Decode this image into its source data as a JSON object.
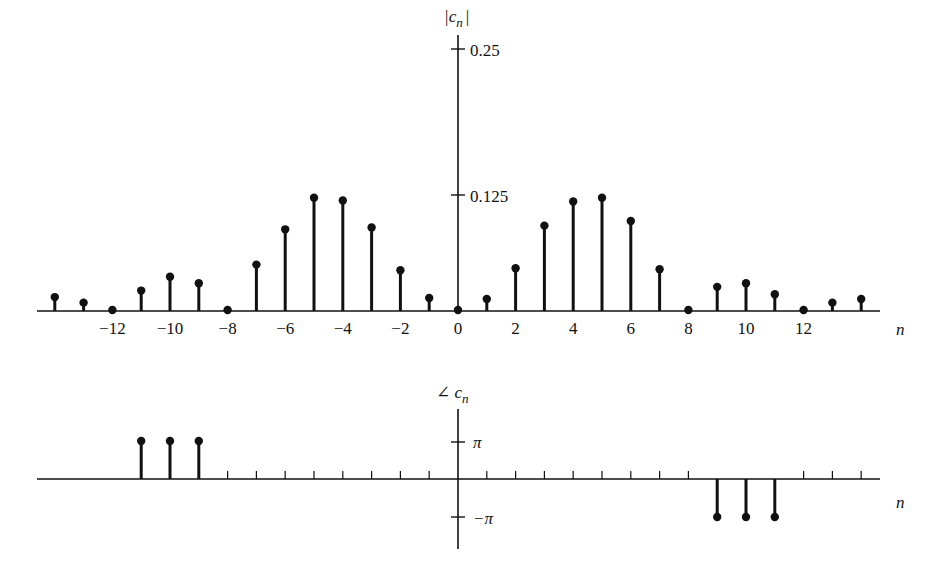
{
  "chart_data": [
    {
      "type": "stem",
      "title": "",
      "ylabel": "|c_n|",
      "xlabel": "n",
      "ytick_labels": [
        "0.125",
        "0.25"
      ],
      "yticks": [
        0.125,
        0.25
      ],
      "xtick_labels": [
        "-12",
        "-10",
        "-8",
        "-6",
        "-4",
        "-2",
        "0",
        "2",
        "4",
        "6",
        "8",
        "10",
        "12"
      ],
      "x": [
        -14,
        -13,
        -12,
        -11,
        -10,
        -9,
        -8,
        -7,
        -6,
        -5,
        -4,
        -3,
        -2,
        -1,
        0,
        1,
        2,
        3,
        4,
        5,
        6,
        7,
        8,
        9,
        10,
        11,
        12,
        13,
        14
      ],
      "values": [
        0.015,
        0.009,
        0.0,
        0.022,
        0.037,
        0.03,
        0.0,
        0.05,
        0.088,
        0.122,
        0.119,
        0.09,
        0.044,
        0.014,
        0.0,
        0.013,
        0.046,
        0.092,
        0.118,
        0.122,
        0.097,
        0.045,
        0.0,
        0.026,
        0.03,
        0.018,
        0.0,
        0.009,
        0.013
      ],
      "grid": false
    },
    {
      "type": "stem",
      "title": "",
      "ylabel": "∠ c_n",
      "xlabel": "n",
      "ytick_labels": [
        "π",
        "−π"
      ],
      "yticks": [
        3.1416,
        -3.1416
      ],
      "x": [
        -14,
        -13,
        -12,
        -11,
        -10,
        -9,
        -8,
        -7,
        -6,
        -5,
        -4,
        -3,
        -2,
        -1,
        0,
        1,
        2,
        3,
        4,
        5,
        6,
        7,
        8,
        9,
        10,
        11,
        12,
        13,
        14
      ],
      "values": [
        0,
        0,
        0,
        3.1416,
        3.1416,
        3.1416,
        0,
        0,
        0,
        0,
        0,
        0,
        0,
        0,
        0,
        0,
        0,
        0,
        0,
        0,
        0,
        0,
        0,
        -3.1416,
        -3.1416,
        -3.1416,
        0,
        0,
        0
      ],
      "grid": false
    }
  ],
  "magnitude_plot": {
    "ylabel_main": "|c",
    "ylabel_sub": "n",
    "ylabel_close": "|",
    "tick_top": "0.25",
    "tick_mid": "0.125",
    "xlabel": "n",
    "xticks": [
      {
        "n": -12,
        "label": "−12"
      },
      {
        "n": -10,
        "label": "−10"
      },
      {
        "n": -8,
        "label": "−8"
      },
      {
        "n": -6,
        "label": "−6"
      },
      {
        "n": -4,
        "label": "−4"
      },
      {
        "n": -2,
        "label": "−2"
      },
      {
        "n": 0,
        "label": "0"
      },
      {
        "n": 2,
        "label": "2"
      },
      {
        "n": 4,
        "label": "4"
      },
      {
        "n": 6,
        "label": "6"
      },
      {
        "n": 8,
        "label": "8"
      },
      {
        "n": 10,
        "label": "10"
      },
      {
        "n": 12,
        "label": "12"
      }
    ]
  },
  "phase_plot": {
    "ylabel_main": "∠ c",
    "ylabel_sub": "n",
    "tick_pos": "π",
    "tick_neg": "−π",
    "xlabel": "n"
  },
  "colors": {
    "ink": "#111111",
    "background": "#ffffff"
  }
}
